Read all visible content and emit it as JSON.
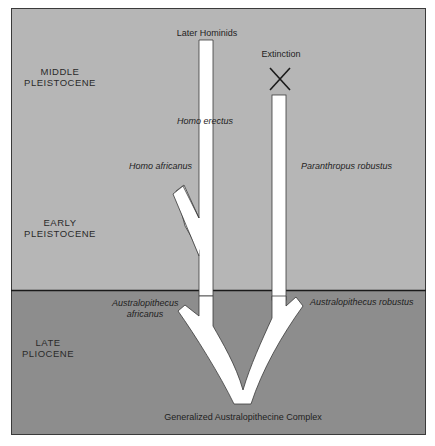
{
  "diagram": {
    "colors": {
      "background": "#ffffff",
      "pleistocene_band": "#b6b6b6",
      "pliocene_band": "#8d8d8d",
      "lineage_fill": "#ffffff",
      "lineage_stroke": "#3a3a3a",
      "frame": "#2a2a2a",
      "text": "#1e1e1e"
    },
    "epochs": [
      {
        "id": "middle-pleistocene",
        "line1": "MIDDLE",
        "line2": "PLEISTOCENE"
      },
      {
        "id": "early-pleistocene",
        "line1": "EARLY",
        "line2": "PLEISTOCENE"
      },
      {
        "id": "late-pliocene",
        "line1": "LATE",
        "line2": "PLIOCENE"
      }
    ],
    "labels": {
      "later_hominids": "Later Hominids",
      "extinction": "Extinction",
      "homo_erectus": "Homo erectus",
      "homo_africanus": "Homo africanus",
      "paranthropus_robustus": "Paranthropus robustus",
      "australopithecus_africanus_line1": "Australopithecus",
      "australopithecus_africanus_line2": "africanus",
      "australopithecus_robustus": "Australopithecus robustus",
      "root": "Generalized Australopithecine Complex"
    },
    "markers": {
      "extinction_icon": "x-mark"
    }
  }
}
